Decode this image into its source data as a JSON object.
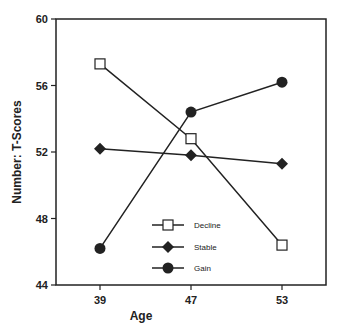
{
  "chart_data": {
    "type": "line",
    "title": "",
    "xlabel": "Age",
    "ylabel": "Number: T-Scores",
    "categories": [
      "39",
      "47",
      "53"
    ],
    "x": [
      39,
      47,
      53
    ],
    "ylim": [
      44,
      60
    ],
    "yticks": [
      "44",
      "48",
      "52",
      "56",
      "60"
    ],
    "grid": false,
    "legend_position": "lower center inside",
    "series": [
      {
        "name": "Decline",
        "marker": "open-square",
        "values": [
          57.3,
          52.8,
          46.4
        ]
      },
      {
        "name": "Stable",
        "marker": "filled-diamond",
        "values": [
          52.2,
          51.8,
          51.3
        ]
      },
      {
        "name": "Gain",
        "marker": "filled-circle",
        "values": [
          46.2,
          54.4,
          56.2
        ]
      }
    ]
  },
  "colors": {
    "line": "#222222",
    "background": "#ffffff"
  }
}
